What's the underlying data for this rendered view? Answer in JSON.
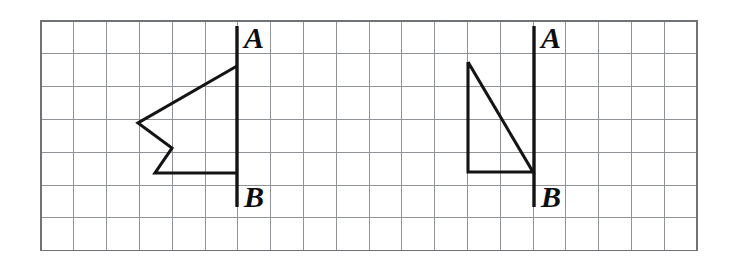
{
  "figure": {
    "background_color": "#ffffff",
    "ink_color": "#141414",
    "grid_color": "#8f9296",
    "grid": {
      "origin_x": 41,
      "origin_y": 21,
      "cell_size": 32.8,
      "columns": 20,
      "rows": 7,
      "show_border": true
    },
    "labels": {
      "a": "A",
      "b": "B"
    },
    "items": [
      {
        "name": "left-figure",
        "segment_label_top": "A",
        "segment_label_bottom": "B",
        "segment": {
          "x1": 237,
          "y1": 26,
          "x2": 237,
          "y2": 207
        },
        "label_a_pos": {
          "x": 244,
          "y": 48
        },
        "label_b_pos": {
          "x": 244,
          "y": 207
        },
        "shape_type": "concave-arrow-polyline",
        "points": "237,66 138,123 172,148 155,173 237,173"
      },
      {
        "name": "right-figure",
        "segment_label_top": "A",
        "segment_label_bottom": "B",
        "segment": {
          "x1": 534,
          "y1": 26,
          "x2": 534,
          "y2": 207
        },
        "label_a_pos": {
          "x": 541,
          "y": 48
        },
        "label_b_pos": {
          "x": 541,
          "y": 207
        },
        "shape_type": "right-triangle",
        "points": "468,62 468,172 533,172 468,62"
      }
    ]
  }
}
